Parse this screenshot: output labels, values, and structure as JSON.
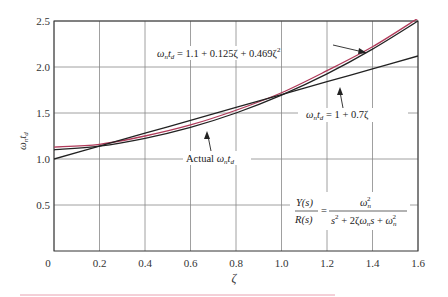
{
  "chart_data": {
    "type": "line",
    "title": "",
    "xlabel": "ζ",
    "ylabel": "ωₙt_d",
    "xlim": [
      0,
      1.6
    ],
    "ylim": [
      0,
      2.5
    ],
    "grid": true,
    "x_ticks": [
      "0",
      "0.2",
      "0.4",
      "0.6",
      "0.8",
      "1.0",
      "1.2",
      "1.4",
      "1.6"
    ],
    "y_ticks": [
      "0.5",
      "1.0",
      "1.5",
      "2.0",
      "2.5"
    ],
    "x": [
      0,
      0.2,
      0.4,
      0.6,
      0.8,
      1.0,
      1.2,
      1.4,
      1.6
    ],
    "series": [
      {
        "name": "Actual ωₙt_d",
        "color": "#b03a5a",
        "values": [
          1.13,
          1.16,
          1.25,
          1.37,
          1.53,
          1.72,
          1.96,
          2.22,
          2.53
        ]
      },
      {
        "name": "ωₙt_d = 1.1 + 0.125ζ + 0.469ζ²",
        "color": "#222222",
        "values": [
          1.1,
          1.14,
          1.225,
          1.344,
          1.5,
          1.694,
          1.925,
          2.194,
          2.5
        ]
      },
      {
        "name": "ωₙt_d = 1 + 0.7ζ",
        "color": "#222222",
        "values": [
          1.0,
          1.14,
          1.28,
          1.42,
          1.56,
          1.7,
          1.84,
          1.98,
          2.12
        ]
      }
    ],
    "annotations": [
      {
        "text": "ωₙt_d = 1.1 + 0.125ζ + 0.469ζ²",
        "points_to": "quadratic fit near ζ≈1.4"
      },
      {
        "text": "ωₙt_d = 1 + 0.7ζ",
        "points_to": "linear fit near ζ≈1.2"
      },
      {
        "text": "Actual ωₙt_d",
        "points_to": "actual curve near ζ≈0.6"
      },
      {
        "text": "Y(s)/R(s) = ωₙ² / (s² + 2ζωₙs + ωₙ²)",
        "points_to": "transfer function"
      }
    ]
  },
  "labels": {
    "quad_prefix": "ω",
    "quad_text": " = 1.1 + 0.125ζ + 0.469ζ",
    "lin_text": " = 1 + 0.7ζ",
    "actual_text": "Actual ",
    "tf_num_left": "Y(s)",
    "tf_den_left": "R(s)",
    "tf_eq": "=",
    "tf_num_right": "ω",
    "tf_den_right": "s² + 2ζω"
  }
}
